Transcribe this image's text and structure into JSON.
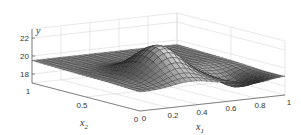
{
  "chart_data": {
    "type": "surface",
    "title": "",
    "xlabel": "x1",
    "ylabel": "x2",
    "zlabel": "y",
    "x1_ticks": [
      "0",
      "0.2",
      "0.4",
      "0.6",
      "0.8",
      "1"
    ],
    "x2_ticks": [
      "0",
      "0.5",
      "1"
    ],
    "z_ticks": [
      "18",
      "20",
      "22"
    ],
    "xlim": [
      0,
      1
    ],
    "ylim": [
      0,
      1
    ],
    "zlim": [
      17,
      23
    ],
    "grid": true,
    "colormap": "gray",
    "peak": {
      "x1": 0.35,
      "x2": 0.3,
      "y": 23.0
    },
    "trough": {
      "x1": 0.8,
      "x2": 0.2,
      "y": 18.0
    },
    "baseline": 19.5
  },
  "labels": {
    "zlabel": "y",
    "xlabel_main": "x",
    "xlabel_sub": "1",
    "ylabel_main": "x",
    "ylabel_sub": "2"
  }
}
